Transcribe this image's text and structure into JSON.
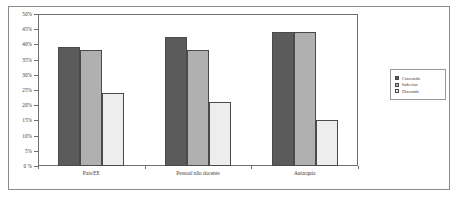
{
  "chart_data": {
    "type": "bar",
    "title": "",
    "xlabel": "",
    "ylabel": "",
    "ylim": [
      0,
      50
    ],
    "ytick_labels": [
      "50%",
      "45%",
      "40%",
      "35%",
      "30%",
      "25%",
      "20%",
      "15%",
      "10%",
      "5%",
      "0 %"
    ],
    "ytick_values": [
      50,
      45,
      40,
      35,
      30,
      25,
      20,
      15,
      10,
      5,
      0
    ],
    "grid": false,
    "legend_position": "right",
    "categories": [
      "Pais/EE",
      "Pessoal não docente",
      "Autarquia"
    ],
    "series": [
      {
        "name": "Concordo",
        "color": "#5b5b5b",
        "values": [
          39,
          42.5,
          44
        ]
      },
      {
        "name": "Indeciso",
        "color": "#b0b0b0",
        "values": [
          38,
          38,
          44
        ]
      },
      {
        "name": "Discordo",
        "color": "#ededed",
        "values": [
          24,
          21,
          15
        ]
      }
    ]
  }
}
